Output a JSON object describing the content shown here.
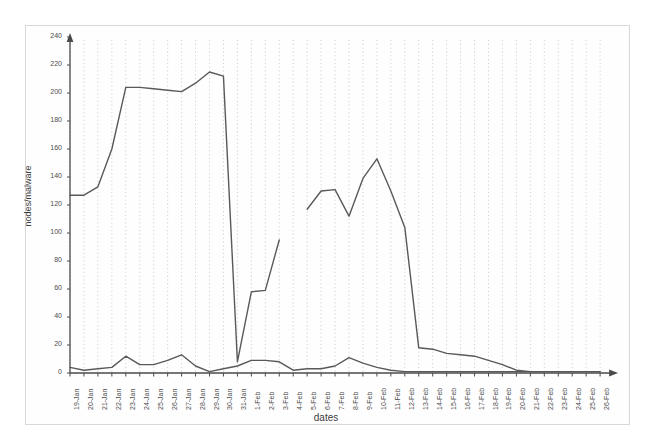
{
  "chart_data": {
    "type": "line",
    "title": "",
    "xlabel": "dates",
    "ylabel": "nodes/malware",
    "ylim": [
      0,
      240
    ],
    "ytick_step": 20,
    "yticks": [
      0,
      20,
      40,
      60,
      80,
      100,
      120,
      140,
      160,
      180,
      200,
      220,
      240
    ],
    "grid": "vertical-dotted",
    "legend": "none",
    "line_color": "#59595b",
    "categories": [
      "19-Jan",
      "20-Jan",
      "21-Jan",
      "22-Jan",
      "23-Jan",
      "24-Jan",
      "25-Jan",
      "26-Jan",
      "27-Jan",
      "28-Jan",
      "29-Jan",
      "30-Jan",
      "31-Jan",
      "1-Feb",
      "2-Feb",
      "3-Feb",
      "4-Feb",
      "5-Feb",
      "6-Feb",
      "7-Feb",
      "8-Feb",
      "9-Feb",
      "10-Feb",
      "11-Feb",
      "12-Feb",
      "13-Feb",
      "14-Feb",
      "15-Feb",
      "16-Feb",
      "17-Feb",
      "18-Feb",
      "19-Feb",
      "20-Feb",
      "21-Feb",
      "22-Feb",
      "23-Feb",
      "24-Feb",
      "25-Feb",
      "26-Feb"
    ],
    "series": [
      {
        "name": "nodes",
        "values": [
          127,
          127,
          133,
          160,
          204,
          204,
          203,
          202,
          201,
          207,
          215,
          212,
          8,
          58,
          59,
          95,
          null,
          117,
          130,
          131,
          112,
          139,
          153,
          130,
          104,
          18,
          17,
          14,
          13,
          12,
          9,
          6,
          2,
          1,
          1,
          1,
          1,
          1,
          1
        ]
      },
      {
        "name": "malware",
        "values": [
          4,
          2,
          3,
          4,
          12,
          6,
          6,
          9,
          13,
          5,
          1,
          3,
          5,
          9,
          9,
          8,
          2,
          3,
          3,
          5,
          11,
          7,
          4,
          2,
          1,
          1,
          1,
          1,
          1,
          1,
          1,
          1,
          1,
          1,
          1,
          1,
          1,
          1,
          1
        ]
      }
    ]
  },
  "axes": {
    "y_axis_name": "y-axis",
    "x_axis_name": "x-axis"
  }
}
